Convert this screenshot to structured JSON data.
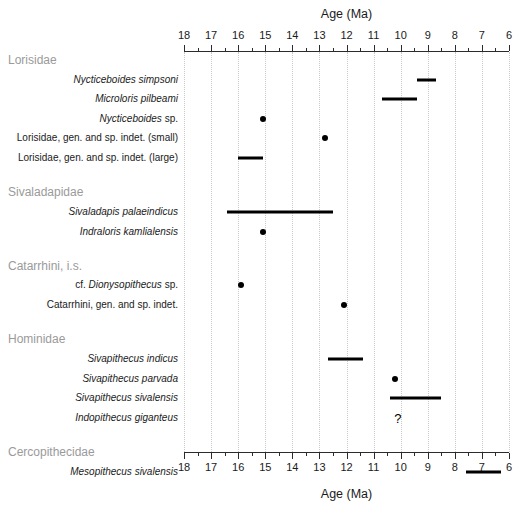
{
  "chart_data": {
    "type": "range",
    "title": "",
    "xlabel": "Age (Ma)",
    "ylabel": "",
    "xlim": [
      18,
      6
    ],
    "x_reversed": true,
    "x_ticks_major": [
      18,
      17,
      16,
      15,
      14,
      13,
      12,
      11,
      10,
      9,
      8,
      7,
      6
    ],
    "x_tick_labels": [
      "18",
      "17",
      "16",
      "15",
      "14",
      "13",
      "12",
      "11",
      "10",
      "9",
      "8",
      "7",
      "6"
    ],
    "x_ticks_minor": [
      17.5,
      16.5,
      15.5,
      14.5,
      13.5,
      12.5,
      11.5,
      10.5,
      9.5,
      8.5,
      7.5,
      6.5
    ],
    "grid": true,
    "grid_axis": "x",
    "grid_style": "dotted",
    "axis_top": true,
    "axis_bottom": true,
    "groups": [
      {
        "name": "Lorisidae",
        "taxa": [
          {
            "label": "Nycticeboides simpsoni",
            "italic": true,
            "mark": "range",
            "start": 9.4,
            "end": 8.7
          },
          {
            "label": "Microloris pilbeami",
            "italic": true,
            "mark": "range",
            "start": 10.7,
            "end": 9.4
          },
          {
            "label": "Nycticeboides sp.",
            "italic": "partial",
            "mark": "point",
            "value": 15.1
          },
          {
            "label": "Lorisidae, gen. and sp. indet. (small)",
            "italic": false,
            "mark": "point",
            "value": 12.8
          },
          {
            "label": "Lorisidae, gen. and sp. indet. (large)",
            "italic": false,
            "mark": "range",
            "start": 16.0,
            "end": 15.1
          }
        ]
      },
      {
        "name": "Sivaladapidae",
        "taxa": [
          {
            "label": "Sivaladapis palaeindicus",
            "italic": true,
            "mark": "range",
            "start": 16.4,
            "end": 12.5
          },
          {
            "label": "Indraloris kamlialensis",
            "italic": true,
            "mark": "point",
            "value": 15.1
          }
        ]
      },
      {
        "name": "Catarrhini, i.s.",
        "taxa": [
          {
            "label": "cf. Dionysopithecus sp.",
            "italic": "partial",
            "mark": "point",
            "value": 15.9
          },
          {
            "label": "Catarrhini, gen. and sp. indet.",
            "italic": false,
            "mark": "point",
            "value": 12.1
          }
        ]
      },
      {
        "name": "Hominidae",
        "taxa": [
          {
            "label": "Sivapithecus indicus",
            "italic": true,
            "mark": "range",
            "start": 12.7,
            "end": 11.4
          },
          {
            "label": "Sivapithecus parvada",
            "italic": true,
            "mark": "point",
            "value": 10.2
          },
          {
            "label": "Sivapithecus sivalensis",
            "italic": true,
            "mark": "range",
            "start": 10.4,
            "end": 8.5
          },
          {
            "label": "Indopithecus giganteus",
            "italic": true,
            "mark": "query",
            "value": 10.1,
            "symbol": "?"
          }
        ]
      },
      {
        "name": "Cercopithecidae",
        "taxa": [
          {
            "label": "Mesopithecus sivalensis",
            "italic": true,
            "mark": "range",
            "start": 7.6,
            "end": 6.3
          }
        ]
      }
    ]
  },
  "axis": {
    "title_top": "Age (Ma)",
    "title_bottom": "Age (Ma)"
  },
  "colors": {
    "mark": "#000000",
    "axis": "#2b2b2b",
    "grid": "#c9c9c9",
    "group_label": "#9a9a9a",
    "text": "#1a1a1a"
  }
}
